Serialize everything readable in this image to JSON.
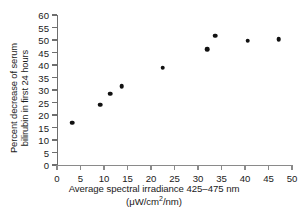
{
  "chart_data": {
    "type": "scatter",
    "title": "",
    "xlabel": "Average spectral irradiance 425–475 nm",
    "xlabel_units": "(μW/cm2/nm)",
    "ylabel_line1": "Percent decrease of serum",
    "ylabel_line2": "bilirubin in first 24 hours",
    "xlim": [
      0,
      50
    ],
    "ylim": [
      0,
      60
    ],
    "xticks": [
      0,
      5,
      10,
      15,
      20,
      25,
      30,
      35,
      40,
      45,
      50
    ],
    "yticks": [
      0,
      5,
      10,
      15,
      20,
      25,
      30,
      35,
      40,
      45,
      50,
      55,
      60
    ],
    "grid": false,
    "legend": null,
    "marker": "filled-circle",
    "marker_color": "#111111",
    "axis_color": "#6e6e6e",
    "points": [
      {
        "x": 3.2,
        "y": 17.0
      },
      {
        "x": 9.2,
        "y": 24.2
      },
      {
        "x": 11.3,
        "y": 28.6
      },
      {
        "x": 13.8,
        "y": 31.5
      },
      {
        "x": 22.5,
        "y": 39.0
      },
      {
        "x": 32.0,
        "y": 46.3
      },
      {
        "x": 33.6,
        "y": 51.8
      },
      {
        "x": 40.6,
        "y": 49.8
      },
      {
        "x": 47.2,
        "y": 50.3
      }
    ]
  }
}
